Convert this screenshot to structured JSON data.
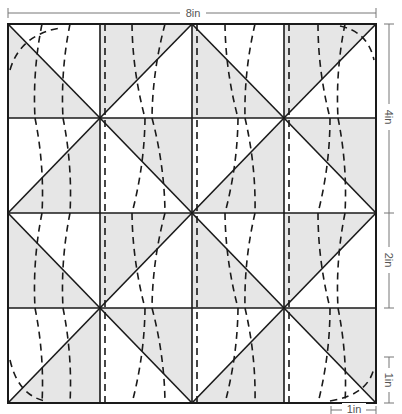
{
  "diagram": {
    "type": "quilt-block-pattern",
    "grid": {
      "rows": 4,
      "cols": 4
    },
    "colors": {
      "shade": "#e6e6e6",
      "line": "#1a1a1a",
      "dim_line": "#777777",
      "background": "#ffffff"
    },
    "cell_pattern": [
      [
        "diag-down-shade-lower-left",
        "diag-up-shade-upper-left",
        "diag-down-shade-lower-left",
        "diag-up-shade-upper-left"
      ],
      [
        "diag-up-shade-lower-right",
        "diag-down-shade-upper-right",
        "diag-up-shade-lower-right",
        "diag-down-shade-upper-right"
      ],
      [
        "diag-down-shade-lower-left",
        "diag-up-shade-upper-left",
        "diag-down-shade-lower-left",
        "diag-up-shade-upper-left"
      ],
      [
        "diag-up-shade-lower-right",
        "diag-down-shade-upper-right",
        "diag-up-shade-lower-right",
        "diag-down-shade-upper-right"
      ]
    ],
    "dimensions": {
      "top_width": "8in",
      "right_upper": "4in",
      "right_middle": "2in",
      "right_lower": "1in",
      "bottom_right": "1in"
    },
    "curve_style": "dashed"
  }
}
